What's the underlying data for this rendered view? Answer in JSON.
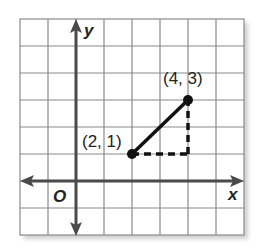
{
  "diagram": {
    "type": "coordinate-grid",
    "grid": {
      "columns": 8,
      "rows": 8,
      "x_min": -2,
      "x_max": 6,
      "y_min": -2,
      "y_max": 6,
      "line_color": "#8a8a8a",
      "axis_color": "#4a4a4a"
    },
    "axes": {
      "x_label": "x",
      "y_label": "y",
      "origin_label": "O"
    },
    "points": [
      {
        "label": "(2, 1)",
        "x": 2,
        "y": 1
      },
      {
        "label": "(4, 3)",
        "x": 4,
        "y": 3
      }
    ],
    "segment": {
      "from": [
        2,
        1
      ],
      "to": [
        4,
        3
      ],
      "style": "solid",
      "color": "#111111"
    },
    "dashed_legs": [
      {
        "from": [
          2,
          1
        ],
        "to": [
          4,
          1
        ]
      },
      {
        "from": [
          4,
          1
        ],
        "to": [
          4,
          3
        ]
      }
    ]
  }
}
